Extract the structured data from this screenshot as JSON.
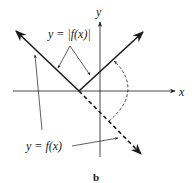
{
  "figure": {
    "caption": "b",
    "axes": {
      "x_label": "x",
      "y_label": "y"
    },
    "labels": {
      "abs_function": "y = |f(x)|",
      "function": "y = f(x)"
    },
    "elements": [
      {
        "name": "graph of y=|f(x)|",
        "style": "solid",
        "description": "V-shaped graph with vertex on x-axis left of origin, both rays pointing upward"
      },
      {
        "name": "graph of y=f(x)",
        "style": "solid then dashed",
        "description": "line descending from upper-left through vertex, continuing dashed below the x-axis to lower-right"
      },
      {
        "name": "reflection arc",
        "style": "dashed",
        "description": "curved dashed arrow showing reflection of the dashed part across the x-axis to the upper-right ray"
      }
    ]
  }
}
